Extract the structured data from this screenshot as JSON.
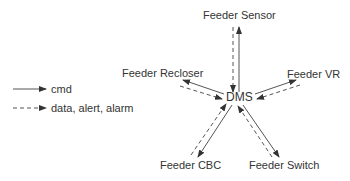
{
  "diagram": {
    "center": {
      "label": "DMS"
    },
    "nodes": [
      {
        "id": "sensor",
        "label": "Feeder Sensor"
      },
      {
        "id": "recloser",
        "label": "Feeder Recloser"
      },
      {
        "id": "vr",
        "label": "Feeder VR"
      },
      {
        "id": "cbc",
        "label": "Feeder CBC"
      },
      {
        "id": "switch",
        "label": "Feeder Switch"
      }
    ],
    "edges": [
      {
        "from": "DMS",
        "to": "Feeder Sensor",
        "type": "cmd"
      },
      {
        "from": "Feeder Sensor",
        "to": "DMS",
        "type": "data"
      },
      {
        "from": "DMS",
        "to": "Feeder Recloser",
        "type": "cmd"
      },
      {
        "from": "Feeder Recloser",
        "to": "DMS",
        "type": "data"
      },
      {
        "from": "DMS",
        "to": "Feeder VR",
        "type": "cmd"
      },
      {
        "from": "Feeder VR",
        "to": "DMS",
        "type": "data"
      },
      {
        "from": "DMS",
        "to": "Feeder CBC",
        "type": "cmd"
      },
      {
        "from": "Feeder CBC",
        "to": "DMS",
        "type": "data"
      },
      {
        "from": "DMS",
        "to": "Feeder Switch",
        "type": "cmd"
      },
      {
        "from": "Feeder Switch",
        "to": "DMS",
        "type": "data"
      }
    ]
  },
  "legend": {
    "cmd": "cmd",
    "data": "data, alert, alarm"
  },
  "colors": {
    "line": "#3a3a3a",
    "text": "#333333"
  }
}
